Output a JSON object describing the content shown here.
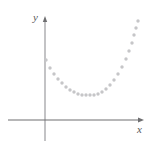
{
  "figure": {
    "name": "parabola-scatter-plot",
    "width": 153,
    "height": 141,
    "background_color": "#ffffff"
  },
  "axes": {
    "x_label": "x",
    "y_label": "y",
    "axis_color": "#6e6e70",
    "y_axis_color": "#c3c3c5",
    "x_axis_y_px": 120,
    "y_axis_x_px": 45,
    "x_axis_start_px": 8,
    "x_axis_end_px": 144,
    "y_axis_top_px": 16,
    "y_axis_bottom_px": 141,
    "has_x_arrow": true,
    "has_y_arrow": true,
    "ticks": [],
    "gridlines": false
  },
  "chart_data": {
    "type": "scatter",
    "title": "",
    "subtitle": "",
    "xlabel": "x",
    "ylabel": "y",
    "legend": [],
    "legend_position": "none",
    "grid": false,
    "marker_color": "#c6c6c8",
    "marker_shape": "circle",
    "marker_size_px": 3.4,
    "xlim": [
      8,
      144
    ],
    "ylim": [
      141,
      16
    ],
    "axis_units": "pixels",
    "note": "Points trace an upward-opening parabola; coordinates are screen pixels (y grows downward).",
    "points": [
      [
        46,
        60
      ],
      [
        50,
        68
      ],
      [
        54,
        74
      ],
      [
        58,
        79
      ],
      [
        62,
        83
      ],
      [
        66,
        87
      ],
      [
        70,
        90
      ],
      [
        74,
        92
      ],
      [
        78,
        94
      ],
      [
        82,
        95
      ],
      [
        86,
        95
      ],
      [
        90,
        95
      ],
      [
        94,
        95
      ],
      [
        98,
        94
      ],
      [
        102,
        92
      ],
      [
        106,
        89
      ],
      [
        110,
        85
      ],
      [
        114,
        80
      ],
      [
        118,
        74
      ],
      [
        122,
        67
      ],
      [
        126,
        59
      ],
      [
        129,
        51
      ],
      [
        132,
        43
      ],
      [
        134,
        35
      ],
      [
        136,
        28
      ],
      [
        138,
        21
      ]
    ]
  }
}
